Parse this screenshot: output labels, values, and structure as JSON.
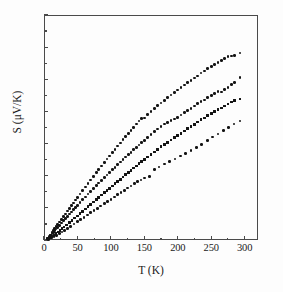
{
  "figure": {
    "kind": "scatter-plot",
    "background": "#fdfdfd",
    "marker_color": "#131313",
    "axis_color": "#4a4a4a"
  },
  "axes": {
    "x": {
      "label": "T (K)",
      "ticks": [
        "0",
        "50",
        "100",
        "150",
        "200",
        "250",
        "300"
      ],
      "min": 0,
      "max": 320
    },
    "y": {
      "label": "S (μV/K)",
      "ticks": [
        "0",
        "2",
        "4",
        "6",
        "8",
        "10",
        "12",
        "14"
      ],
      "min": 0,
      "max": 14
    }
  },
  "chart_data": {
    "type": "scatter",
    "title": "",
    "xlabel": "T (K)",
    "ylabel": "S (μV/K)",
    "xlim": [
      0,
      320
    ],
    "ylim": [
      0,
      14
    ],
    "xticks": [
      0,
      50,
      100,
      150,
      200,
      250,
      300
    ],
    "yticks": [
      0,
      2,
      4,
      6,
      8,
      10,
      12,
      14
    ],
    "grid": false,
    "legend": "none",
    "series": [
      {
        "name": "sample-1",
        "marker": "filled-circle",
        "color": "#131313",
        "points": [
          [
            5,
            0.1
          ],
          [
            8,
            0.22
          ],
          [
            10,
            0.32
          ],
          [
            12,
            0.45
          ],
          [
            14,
            0.58
          ],
          [
            16,
            0.7
          ],
          [
            18,
            0.82
          ],
          [
            20,
            0.95
          ],
          [
            23,
            1.12
          ],
          [
            26,
            1.28
          ],
          [
            29,
            1.45
          ],
          [
            32,
            1.62
          ],
          [
            35,
            1.8
          ],
          [
            38,
            1.97
          ],
          [
            41,
            2.14
          ],
          [
            44,
            2.31
          ],
          [
            47,
            2.48
          ],
          [
            50,
            2.65
          ],
          [
            54,
            2.86
          ],
          [
            58,
            3.08
          ],
          [
            62,
            3.3
          ],
          [
            66,
            3.52
          ],
          [
            70,
            3.74
          ],
          [
            74,
            3.96
          ],
          [
            78,
            4.18
          ],
          [
            82,
            4.4
          ],
          [
            86,
            4.61
          ],
          [
            90,
            4.83
          ],
          [
            94,
            5.03
          ],
          [
            98,
            5.23
          ],
          [
            102,
            5.44
          ],
          [
            106,
            5.64
          ],
          [
            110,
            5.84
          ],
          [
            114,
            6.04
          ],
          [
            118,
            6.24
          ],
          [
            122,
            6.44
          ],
          [
            126,
            6.63
          ],
          [
            130,
            6.82
          ],
          [
            134,
            7.02
          ],
          [
            138,
            7.21
          ],
          [
            142,
            7.4
          ],
          [
            146,
            7.58
          ],
          [
            150,
            7.6
          ],
          [
            155,
            7.82
          ],
          [
            160,
            8.0
          ],
          [
            165,
            8.18
          ],
          [
            170,
            8.36
          ],
          [
            175,
            8.53
          ],
          [
            180,
            8.7
          ],
          [
            185,
            8.86
          ],
          [
            190,
            9.02
          ],
          [
            195,
            9.18
          ],
          [
            200,
            9.34
          ],
          [
            205,
            9.5
          ],
          [
            210,
            9.64
          ],
          [
            215,
            9.79
          ],
          [
            220,
            9.93
          ],
          [
            225,
            10.08
          ],
          [
            230,
            10.2
          ],
          [
            235,
            10.4
          ],
          [
            240,
            10.52
          ],
          [
            245,
            10.66
          ],
          [
            250,
            10.78
          ],
          [
            255,
            10.92
          ],
          [
            260,
            11.04
          ],
          [
            265,
            11.16
          ],
          [
            270,
            11.28
          ],
          [
            275,
            11.4
          ],
          [
            280,
            11.44
          ],
          [
            285,
            11.5
          ],
          [
            293,
            11.64
          ]
        ]
      },
      {
        "name": "sample-2",
        "marker": "filled-circle",
        "color": "#131313",
        "points": [
          [
            5,
            0.08
          ],
          [
            8,
            0.18
          ],
          [
            10,
            0.27
          ],
          [
            12,
            0.37
          ],
          [
            14,
            0.48
          ],
          [
            16,
            0.58
          ],
          [
            18,
            0.68
          ],
          [
            20,
            0.78
          ],
          [
            23,
            0.92
          ],
          [
            26,
            1.06
          ],
          [
            29,
            1.2
          ],
          [
            32,
            1.34
          ],
          [
            35,
            1.48
          ],
          [
            38,
            1.62
          ],
          [
            41,
            1.75
          ],
          [
            44,
            1.89
          ],
          [
            47,
            2.02
          ],
          [
            50,
            2.16
          ],
          [
            54,
            2.33
          ],
          [
            58,
            2.51
          ],
          [
            62,
            2.68
          ],
          [
            66,
            2.86
          ],
          [
            70,
            3.03
          ],
          [
            74,
            3.2
          ],
          [
            78,
            3.37
          ],
          [
            82,
            3.54
          ],
          [
            86,
            3.71
          ],
          [
            90,
            3.88
          ],
          [
            94,
            4.04
          ],
          [
            98,
            4.21
          ],
          [
            102,
            4.37
          ],
          [
            106,
            4.53
          ],
          [
            110,
            4.69
          ],
          [
            114,
            4.85
          ],
          [
            118,
            5.0
          ],
          [
            122,
            5.16
          ],
          [
            126,
            5.31
          ],
          [
            130,
            5.46
          ],
          [
            134,
            5.61
          ],
          [
            138,
            5.76
          ],
          [
            142,
            5.91
          ],
          [
            146,
            6.06
          ],
          [
            150,
            6.2
          ],
          [
            155,
            6.38
          ],
          [
            160,
            6.56
          ],
          [
            165,
            6.73
          ],
          [
            170,
            6.9
          ],
          [
            175,
            7.06
          ],
          [
            180,
            7.22
          ],
          [
            185,
            7.3
          ],
          [
            190,
            7.42
          ],
          [
            195,
            7.52
          ],
          [
            200,
            7.62
          ],
          [
            205,
            7.78
          ],
          [
            210,
            7.92
          ],
          [
            215,
            8.06
          ],
          [
            220,
            8.2
          ],
          [
            225,
            8.34
          ],
          [
            230,
            8.48
          ],
          [
            235,
            8.6
          ],
          [
            240,
            8.72
          ],
          [
            245,
            8.86
          ],
          [
            250,
            8.98
          ],
          [
            255,
            9.1
          ],
          [
            260,
            9.22
          ],
          [
            265,
            9.2
          ],
          [
            270,
            9.36
          ],
          [
            275,
            9.5
          ],
          [
            280,
            9.66
          ],
          [
            285,
            9.82
          ],
          [
            293,
            10.1
          ]
        ]
      },
      {
        "name": "sample-3",
        "marker": "filled-triangle",
        "color": "#131313",
        "points": [
          [
            6,
            0.06
          ],
          [
            9,
            0.14
          ],
          [
            12,
            0.23
          ],
          [
            15,
            0.32
          ],
          [
            18,
            0.41
          ],
          [
            21,
            0.5
          ],
          [
            24,
            0.6
          ],
          [
            27,
            0.7
          ],
          [
            30,
            0.8
          ],
          [
            34,
            0.94
          ],
          [
            38,
            1.08
          ],
          [
            42,
            1.22
          ],
          [
            46,
            1.36
          ],
          [
            50,
            1.5
          ],
          [
            54,
            1.64
          ],
          [
            58,
            1.79
          ],
          [
            62,
            1.93
          ],
          [
            66,
            2.08
          ],
          [
            70,
            2.22
          ],
          [
            74,
            2.36
          ],
          [
            78,
            2.51
          ],
          [
            82,
            2.65
          ],
          [
            86,
            2.8
          ],
          [
            90,
            2.94
          ],
          [
            94,
            3.08
          ],
          [
            98,
            3.22
          ],
          [
            102,
            3.36
          ],
          [
            106,
            3.5
          ],
          [
            110,
            3.64
          ],
          [
            114,
            3.78
          ],
          [
            118,
            3.92
          ],
          [
            122,
            4.06
          ],
          [
            126,
            4.2
          ],
          [
            130,
            4.33
          ],
          [
            134,
            4.47
          ],
          [
            138,
            4.6
          ],
          [
            142,
            4.74
          ],
          [
            146,
            4.87
          ],
          [
            150,
            5.0
          ],
          [
            155,
            5.16
          ],
          [
            160,
            5.32
          ],
          [
            165,
            5.48
          ],
          [
            170,
            5.64
          ],
          [
            175,
            5.8
          ],
          [
            180,
            5.94
          ],
          [
            185,
            6.08
          ],
          [
            190,
            6.22
          ],
          [
            195,
            6.36
          ],
          [
            200,
            6.5
          ],
          [
            205,
            6.64
          ],
          [
            210,
            6.78
          ],
          [
            215,
            6.92
          ],
          [
            220,
            7.06
          ],
          [
            225,
            7.2
          ],
          [
            230,
            7.34
          ],
          [
            235,
            7.48
          ],
          [
            240,
            7.6
          ],
          [
            245,
            7.74
          ],
          [
            250,
            7.86
          ],
          [
            255,
            7.98
          ],
          [
            260,
            8.1
          ],
          [
            265,
            8.22
          ],
          [
            270,
            8.34
          ],
          [
            275,
            8.46
          ],
          [
            280,
            8.58
          ],
          [
            285,
            8.68
          ],
          [
            293,
            8.78
          ]
        ]
      },
      {
        "name": "sample-4",
        "marker": "filled-circle",
        "color": "#131313",
        "points": [
          [
            7,
            0.05
          ],
          [
            11,
            0.12
          ],
          [
            15,
            0.2
          ],
          [
            19,
            0.3
          ],
          [
            23,
            0.4
          ],
          [
            27,
            0.5
          ],
          [
            31,
            0.61
          ],
          [
            35,
            0.72
          ],
          [
            40,
            0.86
          ],
          [
            45,
            1.0
          ],
          [
            50,
            1.14
          ],
          [
            55,
            1.28
          ],
          [
            60,
            1.42
          ],
          [
            65,
            1.56
          ],
          [
            70,
            1.7
          ],
          [
            75,
            1.84
          ],
          [
            80,
            1.98
          ],
          [
            85,
            2.12
          ],
          [
            90,
            2.26
          ],
          [
            95,
            2.4
          ],
          [
            100,
            2.54
          ],
          [
            105,
            2.68
          ],
          [
            110,
            2.82
          ],
          [
            115,
            2.96
          ],
          [
            120,
            3.1
          ],
          [
            125,
            3.24
          ],
          [
            130,
            3.36
          ],
          [
            135,
            3.5
          ],
          [
            140,
            3.62
          ],
          [
            145,
            3.74
          ],
          [
            150,
            3.86
          ],
          [
            158,
            3.95
          ],
          [
            165,
            4.4
          ],
          [
            172,
            4.55
          ],
          [
            180,
            4.72
          ],
          [
            188,
            4.88
          ],
          [
            196,
            5.04
          ],
          [
            204,
            5.22
          ],
          [
            212,
            5.4
          ],
          [
            220,
            5.58
          ],
          [
            228,
            5.76
          ],
          [
            236,
            5.96
          ],
          [
            244,
            6.18
          ],
          [
            252,
            6.4
          ],
          [
            260,
            6.6
          ],
          [
            268,
            6.8
          ],
          [
            276,
            7.0
          ],
          [
            284,
            7.22
          ],
          [
            293,
            7.4
          ]
        ]
      }
    ]
  }
}
